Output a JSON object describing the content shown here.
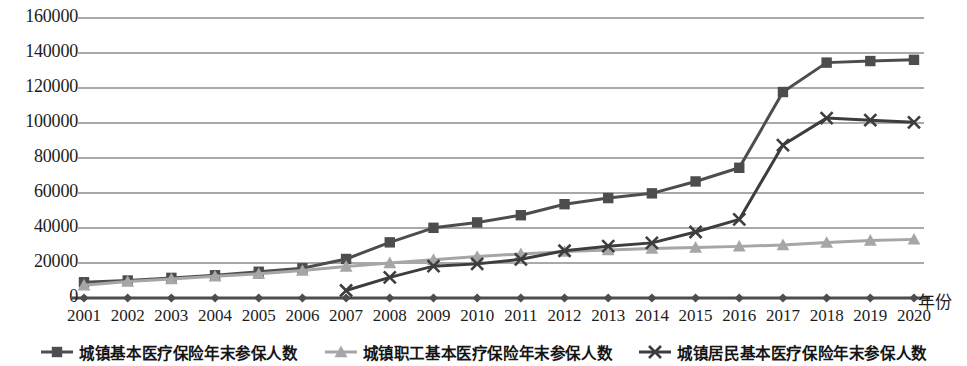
{
  "chart_data": {
    "type": "line",
    "title": "",
    "xlabel": "年份",
    "ylabel": "",
    "x": [
      2001,
      2002,
      2003,
      2004,
      2005,
      2006,
      2007,
      2008,
      2009,
      2010,
      2011,
      2012,
      2013,
      2014,
      2015,
      2016,
      2017,
      2018,
      2019,
      2020
    ],
    "categories": [
      "2001",
      "2002",
      "2003",
      "2004",
      "2005",
      "2006",
      "2007",
      "2008",
      "2009",
      "2010",
      "2011",
      "2012",
      "2013",
      "2014",
      "2015",
      "2016",
      "2017",
      "2018",
      "2019",
      "2020"
    ],
    "ylim": [
      0,
      160000
    ],
    "ytick_step": 20000,
    "yticks": [
      "0",
      "20000",
      "40000",
      "60000",
      "80000",
      "100000",
      "120000",
      "140000",
      "160000"
    ],
    "grid": "horizontal",
    "legend_position": "bottom",
    "series": [
      {
        "name": "城镇基本医疗保险年末参保人数",
        "marker": "square",
        "color": "#4d4d4d",
        "values": [
          9000,
          10000,
          11500,
          13000,
          15000,
          17000,
          22300,
          31800,
          40100,
          43200,
          47300,
          53600,
          57100,
          59800,
          66600,
          74400,
          117700,
          134500,
          135400,
          136100
        ]
      },
      {
        "name": "城镇职工基本医疗保险年末参保人数",
        "marker": "triangle",
        "color": "#a6a6a6",
        "values": [
          7300,
          9400,
          10900,
          12400,
          13800,
          15700,
          18000,
          20000,
          21900,
          23700,
          25200,
          26500,
          27400,
          28300,
          28900,
          29500,
          30300,
          31700,
          32900,
          33500
        ]
      },
      {
        "name": "城镇居民基本医疗保险年末参保人数",
        "marker": "x",
        "color": "#3d3d3d",
        "values": [
          null,
          null,
          null,
          null,
          null,
          null,
          4300,
          11800,
          18200,
          19500,
          22100,
          27000,
          29600,
          31500,
          37700,
          44900,
          87400,
          102800,
          101600,
          100400
        ]
      }
    ]
  },
  "axis": {
    "x_axis_title": "年份"
  },
  "legend": {
    "items": [
      {
        "label": "城镇基本医疗保险年末参保人数",
        "marker": "square",
        "color": "#4d4d4d"
      },
      {
        "label": "城镇职工基本医疗保险年末参保人数",
        "marker": "triangle",
        "color": "#a6a6a6"
      },
      {
        "label": "城镇居民基本医疗保险年末参保人数",
        "marker": "x",
        "color": "#3d3d3d"
      }
    ]
  },
  "colors": {
    "series1": "#4d4d4d",
    "series2": "#a6a6a6",
    "series3": "#3d3d3d",
    "grid": "#8c8c8c",
    "axis": "#4d4d4d",
    "text": "#1c1c1c"
  }
}
